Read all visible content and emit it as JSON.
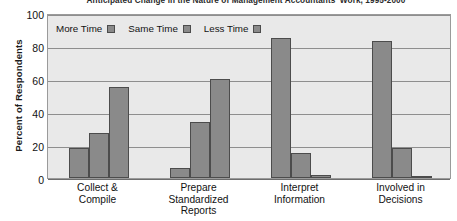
{
  "chart_data": {
    "type": "bar",
    "title": "Anticipated Change in the Nature of Management Accountants' Work, 1995-2000",
    "xlabel": "",
    "ylabel": "Percent of Respondents",
    "ylim": [
      0,
      100
    ],
    "yticks": [
      0,
      20,
      40,
      60,
      80,
      100
    ],
    "grid": true,
    "legend_position": "top-left",
    "categories": [
      "Collect & Compile",
      "Prepare Standardized Reports",
      "Interpret Information",
      "Involved in Decisions"
    ],
    "series": [
      {
        "name": "More Time",
        "values": [
          18,
          6,
          85,
          83
        ]
      },
      {
        "name": "Same Time",
        "values": [
          27,
          34,
          15,
          18
        ]
      },
      {
        "name": "Less Time",
        "values": [
          55,
          60,
          2,
          1
        ]
      }
    ]
  },
  "axis": {
    "y_title": "Percent of Respondents",
    "y_tick_labels": [
      "0",
      "20",
      "40",
      "60",
      "80",
      "100"
    ]
  },
  "legend": {
    "items": [
      {
        "label": "More Time",
        "color": "#8a8a8a"
      },
      {
        "label": "Same Time",
        "color": "#8a8a8a"
      },
      {
        "label": "Less Time",
        "color": "#8a8a8a"
      }
    ]
  },
  "x_categories": [
    {
      "lines": [
        "Collect &",
        "Compile"
      ]
    },
    {
      "lines": [
        "Prepare",
        "Standardized",
        "Reports"
      ]
    },
    {
      "lines": [
        "Interpret",
        "Information"
      ]
    },
    {
      "lines": [
        "Involved in",
        "Decisions"
      ]
    }
  ],
  "style": {
    "bar_fill": "#8a8a8a",
    "bar_edge": "#4c4c4c",
    "plot_background": "#e9e9e9",
    "gridline_color": "#8e8e8e",
    "frame_color": "#9a9a9a",
    "text_color": "#121212",
    "page_background": "#ffffff"
  }
}
